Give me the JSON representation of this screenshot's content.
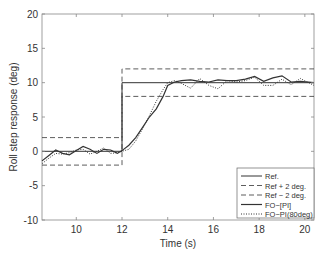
{
  "chart_data": {
    "type": "line",
    "title": "",
    "xlabel": "Time (s)",
    "ylabel": "Roll step response (deg)",
    "xlim": [
      8.5,
      20.4
    ],
    "ylim": [
      -10,
      20
    ],
    "xticks": [
      10,
      12,
      14,
      16,
      18,
      20
    ],
    "yticks": [
      -10,
      -5,
      0,
      5,
      10,
      15,
      20
    ],
    "grid": false,
    "legend_position": "lower right",
    "series": [
      {
        "name": "Ref.",
        "style": "solid",
        "width": 1,
        "x": [
          8.5,
          12.0,
          12.0,
          20.4
        ],
        "y": [
          0,
          0,
          10,
          10
        ]
      },
      {
        "name": "Ref + 2 deg.",
        "style": "dashed",
        "width": 0.8,
        "x": [
          8.5,
          12.0,
          12.0,
          20.4
        ],
        "y": [
          2,
          2,
          12,
          12
        ]
      },
      {
        "name": "Ref − 2 deg.",
        "style": "dashed",
        "width": 0.8,
        "x": [
          8.5,
          12.0,
          12.0,
          20.4
        ],
        "y": [
          -2,
          -2,
          8,
          8
        ]
      },
      {
        "name": "FO−[PI]",
        "style": "solid",
        "width": 1.2,
        "x": [
          8.5,
          8.8,
          9.1,
          9.4,
          9.7,
          10.0,
          10.3,
          10.6,
          10.9,
          11.2,
          11.5,
          11.8,
          12.0,
          12.3,
          12.6,
          12.9,
          13.2,
          13.5,
          13.8,
          14.0,
          14.3,
          14.6,
          15.0,
          15.4,
          15.8,
          16.2,
          16.6,
          17.0,
          17.4,
          17.8,
          18.2,
          18.6,
          19.0,
          19.4,
          19.8,
          20.4
        ],
        "y": [
          -1.4,
          -0.6,
          0.2,
          -0.3,
          -0.5,
          0.1,
          0.7,
          0.3,
          -0.3,
          0.3,
          0.2,
          -0.3,
          0.1,
          0.9,
          2.0,
          3.5,
          5.0,
          6.2,
          8.0,
          9.6,
          10.1,
          10.3,
          10.4,
          10.2,
          10.1,
          10.4,
          10.3,
          10.3,
          10.5,
          10.9,
          10.2,
          10.7,
          11.0,
          10.1,
          10.2,
          10.0
        ]
      },
      {
        "name": "FO−PI(80deg)",
        "style": "dotted",
        "width": 1,
        "x": [
          8.5,
          8.8,
          9.1,
          9.4,
          9.7,
          10.0,
          10.3,
          10.6,
          10.9,
          11.2,
          11.5,
          11.8,
          12.0,
          12.3,
          12.6,
          12.9,
          13.2,
          13.5,
          13.8,
          14.0,
          14.3,
          14.6,
          15.0,
          15.4,
          15.8,
          16.2,
          16.6,
          17.0,
          17.4,
          17.8,
          18.2,
          18.6,
          19.0,
          19.4,
          19.8,
          20.4
        ],
        "y": [
          -1.8,
          -1.0,
          -0.3,
          -0.4,
          -0.2,
          0.2,
          0.3,
          -0.4,
          0.0,
          0.5,
          -0.3,
          -0.2,
          0.0,
          0.3,
          1.5,
          3.3,
          5.2,
          7.3,
          9.0,
          10.0,
          10.3,
          9.9,
          9.2,
          10.6,
          9.6,
          9.1,
          10.3,
          10.1,
          10.3,
          10.8,
          9.6,
          9.6,
          10.5,
          9.7,
          10.6,
          9.6
        ]
      }
    ]
  }
}
